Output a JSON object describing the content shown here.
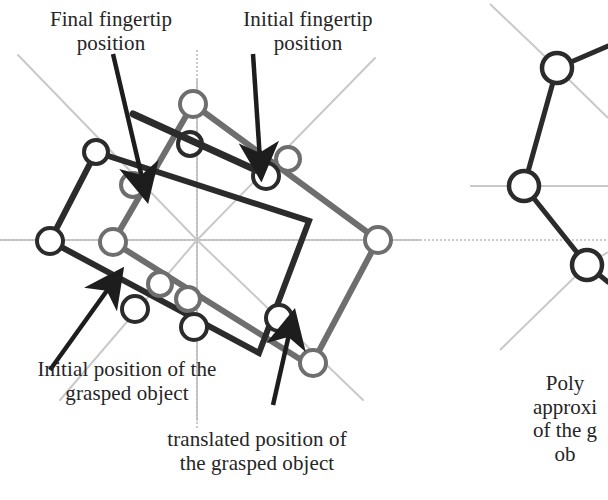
{
  "figure": {
    "background": "#ffffff",
    "colors": {
      "dark_object": "#2b2b2b",
      "translated_object": "#6e6e6e",
      "guide_line": "#c9c9c9",
      "axis_dotted": "#bcbcbc",
      "arrow": "#1d1d1d",
      "text": "#252525"
    }
  },
  "labels": {
    "final_fingertip": "Final fingertip\nposition",
    "initial_fingertip": "Initial fingertip\nposition",
    "initial_object": "Initial position of the\ngrasped object",
    "translated_object": "translated position of\nthe grasped object",
    "polygon_right": "Poly\napproxi\nof the g\nob"
  },
  "geometry": {
    "radial_center": {
      "x": 197,
      "y": 240
    },
    "dark_rect": {
      "name": "initial-position-of-grasped-object",
      "color": "#2b2b2b",
      "points": [
        [
          96,
          152
        ],
        [
          309,
          221
        ],
        [
          259,
          353
        ],
        [
          50,
          241
        ]
      ],
      "stroke_width": 6
    },
    "gray_rect": {
      "name": "translated-position-of-grasped-object",
      "color": "#6e6e6e",
      "points": [
        [
          193,
          104
        ],
        [
          378,
          240
        ],
        [
          311,
          366
        ],
        [
          113,
          242
        ]
      ],
      "stroke_width": 6
    },
    "dark_circles": [
      {
        "x": 96,
        "y": 152,
        "r": 12
      },
      {
        "x": 50,
        "y": 241,
        "r": 13
      },
      {
        "x": 190,
        "y": 144,
        "r": 12
      },
      {
        "x": 266,
        "y": 176,
        "r": 13
      },
      {
        "x": 194,
        "y": 327,
        "r": 13
      },
      {
        "x": 135,
        "y": 309,
        "r": 13
      },
      {
        "x": 279,
        "y": 318,
        "r": 13
      }
    ],
    "gray_circles": [
      {
        "x": 193,
        "y": 104,
        "r": 13
      },
      {
        "x": 133,
        "y": 185,
        "r": 12
      },
      {
        "x": 113,
        "y": 242,
        "r": 13
      },
      {
        "x": 288,
        "y": 159,
        "r": 12
      },
      {
        "x": 378,
        "y": 240,
        "r": 13
      },
      {
        "x": 160,
        "y": 284,
        "r": 12
      },
      {
        "x": 188,
        "y": 299,
        "r": 12
      },
      {
        "x": 313,
        "y": 363,
        "r": 13
      }
    ],
    "radial_guides": [
      [
        [
          18,
          55
        ],
        [
          197,
          240
        ]
      ],
      [
        [
          197,
          80
        ],
        [
          197,
          240
        ]
      ],
      [
        [
          375,
          58
        ],
        [
          197,
          240
        ]
      ],
      [
        [
          420,
          240
        ],
        [
          197,
          240
        ]
      ],
      [
        [
          363,
          400
        ],
        [
          197,
          240
        ]
      ],
      [
        [
          197,
          420
        ],
        [
          197,
          240
        ]
      ],
      [
        [
          60,
          400
        ],
        [
          197,
          240
        ]
      ],
      [
        [
          0,
          240
        ],
        [
          197,
          240
        ]
      ]
    ],
    "axis_h": {
      "x1": 0,
      "y1": 240,
      "x2": 440,
      "y2": 240
    },
    "axis_v": {
      "x1": 197,
      "y1": 50,
      "x2": 197,
      "y2": 430
    },
    "arrows": [
      {
        "name": "arrow-final-fingertip",
        "from": [
          113,
          54
        ],
        "to": [
          143,
          182
        ]
      },
      {
        "name": "arrow-initial-fingertip",
        "from": [
          253,
          54
        ],
        "to": [
          260,
          160
        ]
      },
      {
        "name": "arrow-initial-object",
        "from": [
          50,
          370
        ],
        "to": [
          111,
          285
        ]
      },
      {
        "name": "arrow-translated-object",
        "from": [
          273,
          405
        ],
        "to": [
          290,
          330
        ]
      }
    ],
    "pointer_bar": {
      "name": "fingertip-pointer-bar",
      "from": [
        133,
        114
      ],
      "to": [
        256,
        170
      ]
    },
    "right_panel": {
      "name": "polygonal-approximation-panel",
      "circles": [
        {
          "x": 557,
          "y": 68,
          "r": 15
        },
        {
          "x": 524,
          "y": 186,
          "r": 15
        },
        {
          "x": 587,
          "y": 265,
          "r": 15
        }
      ],
      "edges": [
        [
          [
            557,
            68
          ],
          [
            524,
            186
          ]
        ],
        [
          [
            524,
            186
          ],
          [
            587,
            265
          ]
        ],
        [
          [
            557,
            68
          ],
          [
            608,
            46
          ]
        ],
        [
          [
            587,
            265
          ],
          [
            608,
            282
          ]
        ]
      ],
      "guides": [
        [
          [
            490,
            4
          ],
          [
            557,
            68
          ]
        ],
        [
          [
            557,
            68
          ],
          [
            608,
            118
          ]
        ],
        [
          [
            470,
            186
          ],
          [
            608,
            186
          ]
        ],
        [
          [
            587,
            265
          ],
          [
            500,
            350
          ]
        ],
        [
          [
            587,
            265
          ],
          [
            608,
            252
          ]
        ]
      ]
    }
  }
}
